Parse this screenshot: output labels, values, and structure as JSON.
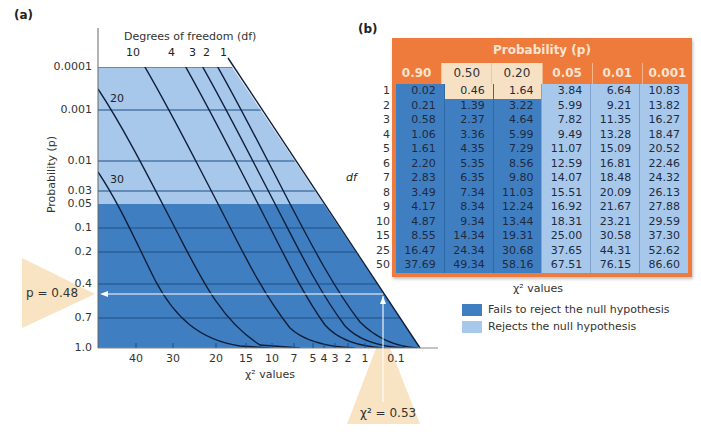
{
  "chart_data": [
    {
      "type": "line",
      "panel": "(a)",
      "title": "Degrees of freedom (df)",
      "xlabel": "χ² values",
      "ylabel": "Probability (p)",
      "y_ticks": [
        "0.0001",
        "0.001",
        "0.01",
        "0.03",
        "0.05",
        "0.1",
        "0.2",
        "0.4",
        "0.7",
        "1.0"
      ],
      "x_ticks": [
        "40",
        "30",
        "20",
        "15",
        "10",
        "7",
        "5",
        "4",
        "3",
        "2",
        "1",
        "0.1"
      ],
      "series": [
        {
          "name": "df 1",
          "label": "1"
        },
        {
          "name": "df 2",
          "label": "2"
        },
        {
          "name": "df 3",
          "label": "3"
        },
        {
          "name": "df 4",
          "label": "4"
        },
        {
          "name": "df 10",
          "label": "10"
        },
        {
          "name": "df 20",
          "label": "20"
        },
        {
          "name": "df 30",
          "label": "30"
        }
      ],
      "regions": [
        {
          "name": "Rejects the null hypothesis",
          "p_range": [
            0.0001,
            0.05
          ],
          "color": "#a7c8ea"
        },
        {
          "name": "Fails to reject the null hypothesis",
          "p_range": [
            0.05,
            1.0
          ],
          "color": "#3f7fc1"
        }
      ],
      "annotations": [
        {
          "text": "p = 0.48",
          "value": 0.48
        },
        {
          "text": "χ² = 0.53",
          "value": 0.53
        }
      ],
      "grid": true
    },
    {
      "type": "table",
      "panel": "(b)",
      "title": "Probability (p)",
      "row_label": "df",
      "footer": "χ² values",
      "columns": [
        "0.90",
        "0.50",
        "0.20",
        "0.05",
        "0.01",
        "0.001"
      ],
      "rows": [
        {
          "df": "1",
          "values": [
            "0.02",
            "0.46",
            "1.64",
            "3.84",
            "6.64",
            "10.83"
          ]
        },
        {
          "df": "2",
          "values": [
            "0.21",
            "1.39",
            "3.22",
            "5.99",
            "9.21",
            "13.82"
          ]
        },
        {
          "df": "3",
          "values": [
            "0.58",
            "2.37",
            "4.64",
            "7.82",
            "11.35",
            "16.27"
          ]
        },
        {
          "df": "4",
          "values": [
            "1.06",
            "3.36",
            "5.99",
            "9.49",
            "13.28",
            "18.47"
          ]
        },
        {
          "df": "5",
          "values": [
            "1.61",
            "4.35",
            "7.29",
            "11.07",
            "15.09",
            "20.52"
          ]
        },
        {
          "df": "6",
          "values": [
            "2.20",
            "5.35",
            "8.56",
            "12.59",
            "16.81",
            "22.46"
          ]
        },
        {
          "df": "7",
          "values": [
            "2.83",
            "6.35",
            "9.80",
            "14.07",
            "18.48",
            "24.32"
          ]
        },
        {
          "df": "8",
          "values": [
            "3.49",
            "7.34",
            "11.03",
            "15.51",
            "20.09",
            "26.13"
          ]
        },
        {
          "df": "9",
          "values": [
            "4.17",
            "8.34",
            "12.24",
            "16.92",
            "21.67",
            "27.88"
          ]
        },
        {
          "df": "10",
          "values": [
            "4.87",
            "9.34",
            "13.44",
            "18.31",
            "23.21",
            "29.59"
          ]
        },
        {
          "df": "15",
          "values": [
            "8.55",
            "14.34",
            "19.31",
            "25.00",
            "30.58",
            "37.30"
          ]
        },
        {
          "df": "25",
          "values": [
            "16.47",
            "24.34",
            "30.68",
            "37.65",
            "44.31",
            "52.62"
          ]
        },
        {
          "df": "50",
          "values": [
            "37.69",
            "49.34",
            "58.16",
            "67.51",
            "76.15",
            "86.60"
          ]
        }
      ],
      "highlight": {
        "df": "1",
        "columns": [
          "0.50",
          "0.20"
        ]
      }
    }
  ],
  "panel_a": {
    "label": "(a)",
    "df_title": "Degrees of freedom (df)",
    "df_top_labels": [
      "10",
      "4",
      "3",
      "2",
      "1"
    ],
    "df_inner_labels": [
      "20",
      "30"
    ],
    "y_ticks": [
      "0.0001",
      "0.001",
      "0.01",
      "0.03",
      "0.05",
      "0.1",
      "0.2",
      "0.4",
      "0.7",
      "1.0"
    ],
    "x_ticks": [
      "40",
      "30",
      "20",
      "15",
      "10",
      "7",
      "5",
      "4",
      "3",
      "2",
      "1",
      "0.1"
    ],
    "ylabel": "Probability (p)",
    "xlabel": "χ² values",
    "callout_p": "p = 0.48",
    "callout_chi": "χ² = 0.53"
  },
  "panel_b": {
    "label": "(b)",
    "title": "Probability (p)",
    "columns": [
      "0.90",
      "0.50",
      "0.20",
      "0.05",
      "0.01",
      "0.001"
    ],
    "df_axis_label": "df",
    "df_values": [
      "1",
      "2",
      "3",
      "4",
      "5",
      "6",
      "7",
      "8",
      "9",
      "10",
      "15",
      "25",
      "50"
    ],
    "footer": "χ² values"
  },
  "legend": {
    "items": [
      {
        "label": "Fails to reject the null hypothesis",
        "color": "#3f7fc1"
      },
      {
        "label": "Rejects the null hypothesis",
        "color": "#a7c8ea"
      }
    ]
  },
  "colors": {
    "dark_blue": "#3f7fc1",
    "light_blue": "#a7c8ea",
    "orange": "#ee7b3b",
    "cream": "#f7e1c5",
    "callout": "#f8e3c2"
  }
}
